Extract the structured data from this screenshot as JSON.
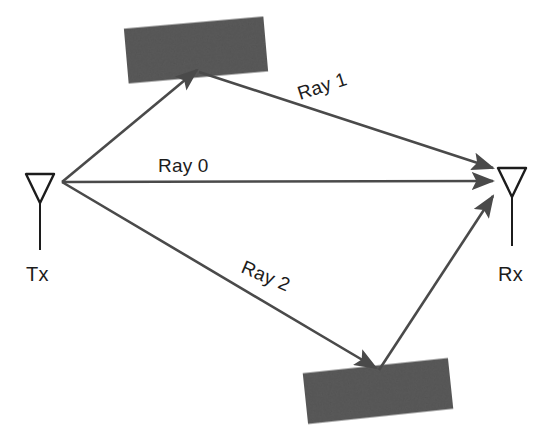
{
  "diagram": {
    "background_color": "#ffffff",
    "line_color": "#4a4a4a",
    "obstacle_color": "#5a5a5a",
    "text_color": "#1c1c1c",
    "width": 549,
    "height": 435
  },
  "nodes": {
    "transmitter": {
      "label": "Tx",
      "icon": "antenna-icon",
      "x": 40,
      "y": 182
    },
    "receiver": {
      "label": "Rx",
      "icon": "antenna-icon",
      "x": 512,
      "y": 180
    }
  },
  "rays": [
    {
      "id": "ray-1",
      "label": "Ray 1",
      "label_x": 300,
      "label_y": 100,
      "label_rotation": -18,
      "path": "reflected-ceiling",
      "from": [
        62,
        182
      ],
      "reflect": [
        197,
        72
      ],
      "to": [
        493,
        168
      ]
    },
    {
      "id": "ray-0",
      "label": "Ray 0",
      "label_x": 158,
      "label_y": 172,
      "label_rotation": 0,
      "path": "line-of-sight",
      "from": [
        62,
        182
      ],
      "to": [
        493,
        181
      ]
    },
    {
      "id": "ray-2",
      "label": "Ray 2",
      "label_x": 240,
      "label_y": 287,
      "label_rotation": 23,
      "path": "reflected-ground",
      "from": [
        62,
        182
      ],
      "reflect": [
        376,
        370
      ],
      "to": [
        493,
        196
      ]
    }
  ],
  "obstacles": [
    {
      "id": "obstacle-top",
      "name": "reflector-top",
      "cx": 196,
      "cy": 50,
      "width": 140,
      "height": 55,
      "rotation": -5
    },
    {
      "id": "obstacle-bottom",
      "name": "reflector-bottom",
      "cx": 378,
      "cy": 391,
      "width": 146,
      "height": 51,
      "rotation": -6
    }
  ]
}
